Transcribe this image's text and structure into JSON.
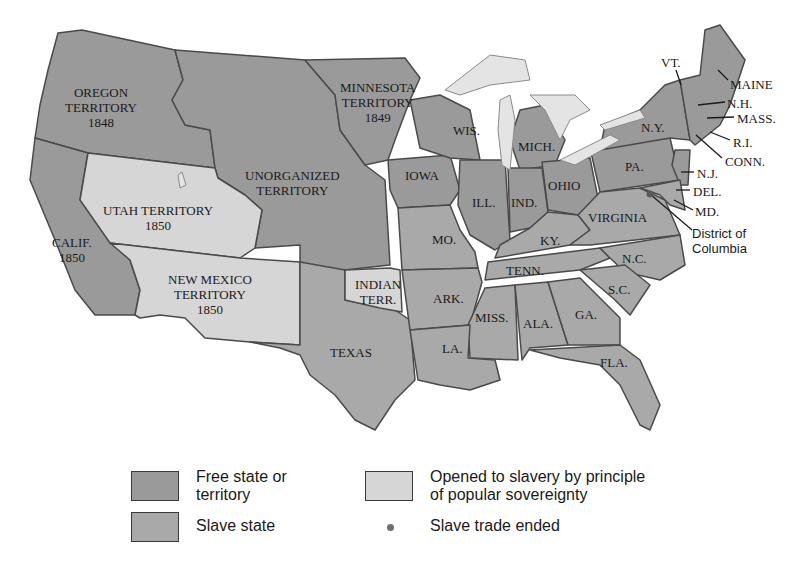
{
  "colors": {
    "free": "#9a9a9a",
    "slave": "#a9a9a9",
    "popular_sovereignty": "#d6d6d6",
    "lakes": "#e4e4e4",
    "border": "#4a4a4a",
    "dot": "#707070"
  },
  "regions": {
    "oregon": {
      "name": "OREGON",
      "line2": "TERRITORY",
      "year": "1848"
    },
    "minnesota": {
      "name": "MINNESOTA",
      "line2": "TERRITORY",
      "year": "1849"
    },
    "unorganized": {
      "name": "UNORGANIZED",
      "line2": "TERRITORY"
    },
    "utah": {
      "name": "UTAH TERRITORY",
      "year": "1850"
    },
    "calif": {
      "name": "CALIF.",
      "year": "1850"
    },
    "new_mexico": {
      "name": "NEW MEXICO",
      "line2": "TERRITORY",
      "year": "1850"
    },
    "indian": {
      "name": "INDIAN",
      "line2": "TERR."
    },
    "texas": "TEXAS",
    "iowa": "IOWA",
    "wis": "WIS.",
    "mich": "MICH.",
    "ill": "ILL.",
    "ind": "IND.",
    "ohio": "OHIO",
    "mo": "MO.",
    "ky": "KY.",
    "ark": "ARK.",
    "tenn": "TENN.",
    "miss": "MISS.",
    "ala": "ALA.",
    "ga": "GA.",
    "la": "LA.",
    "fla": "FLA.",
    "sc": "S.C.",
    "nc": "N.C.",
    "virginia": "VIRGINIA",
    "pa": "PA.",
    "ny": "N.Y.",
    "vt": "VT.",
    "maine": "MAINE",
    "nh": "N.H.",
    "mass": "MASS.",
    "ri": "R.I.",
    "conn": "CONN.",
    "nj": "N.J.",
    "del": "DEL.",
    "md": "MD.",
    "dc_line1": "District of",
    "dc_line2": "Columbia"
  },
  "legend": {
    "free_line1": "Free state or",
    "free_line2": "territory",
    "slave": "Slave state",
    "popular_line1": "Opened to slavery by principle",
    "popular_line2": "of popular sovereignty",
    "trade": "Slave trade ended"
  }
}
